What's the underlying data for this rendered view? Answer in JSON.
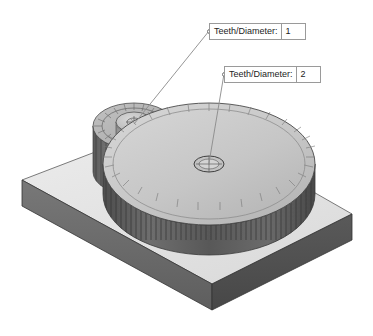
{
  "viewport": {
    "background_color": "#ffffff",
    "title": "Gear Assembly Annotated Isometric View"
  },
  "callouts": [
    {
      "id": "callout-1",
      "label": "Teeth/Diameter:",
      "value": "1",
      "target": "small-pinion-gear",
      "anchor_icon": "leader-anchor-circle-icon"
    },
    {
      "id": "callout-2",
      "label": "Teeth/Diameter:",
      "value": "2",
      "target": "large-spur-gear",
      "anchor_icon": "leader-anchor-circle-icon"
    }
  ],
  "model": {
    "base_plate": {
      "name": "base-plate",
      "top_face_color": "#e6e6e6",
      "front_face_color": "#6a6a6a",
      "side_face_color": "#4f4f4f",
      "edge_color": "#2f2f2f"
    },
    "large_gear": {
      "name": "large-spur-gear",
      "top_face_color": "#c9c9c9",
      "rim_color": "#5d5d5d",
      "tooth_count_drawn": 62,
      "bore_icon": "center-bore-crosshair-icon"
    },
    "small_gear": {
      "name": "small-pinion-gear",
      "top_face_color": "#b4b4b4",
      "rim_color": "#6b6b6b",
      "hub_color": "#9d9d9d",
      "tooth_count_drawn": 24,
      "bore_icon": "center-bore-crosshair-icon"
    },
    "leader_lines": {
      "name": "leader-lines",
      "color": "#8a8a8a"
    }
  }
}
